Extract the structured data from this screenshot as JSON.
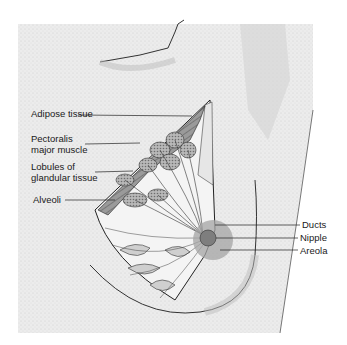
{
  "figure": {
    "labels_left": [
      {
        "id": "adipose",
        "text": "Adipose tissue"
      },
      {
        "id": "pectoralis_1",
        "text": "Pectoralis"
      },
      {
        "id": "pectoralis_2",
        "text": "major muscle"
      },
      {
        "id": "lobules_1",
        "text": "Lobules of"
      },
      {
        "id": "lobules_2",
        "text": "glandular tissue"
      },
      {
        "id": "alveoli",
        "text": "Alveoli"
      }
    ],
    "labels_right": [
      {
        "id": "ducts",
        "text": "Ducts"
      },
      {
        "id": "nipple",
        "text": "Nipple"
      },
      {
        "id": "areola",
        "text": "Areola"
      }
    ],
    "colors": {
      "background_panel": "#ececec",
      "skin_shade": "#d9d9d9",
      "muscle": "#8e8e8e",
      "lobule": "#b0b0b0",
      "areola": "#9a9a9a",
      "line": "#222222"
    }
  }
}
